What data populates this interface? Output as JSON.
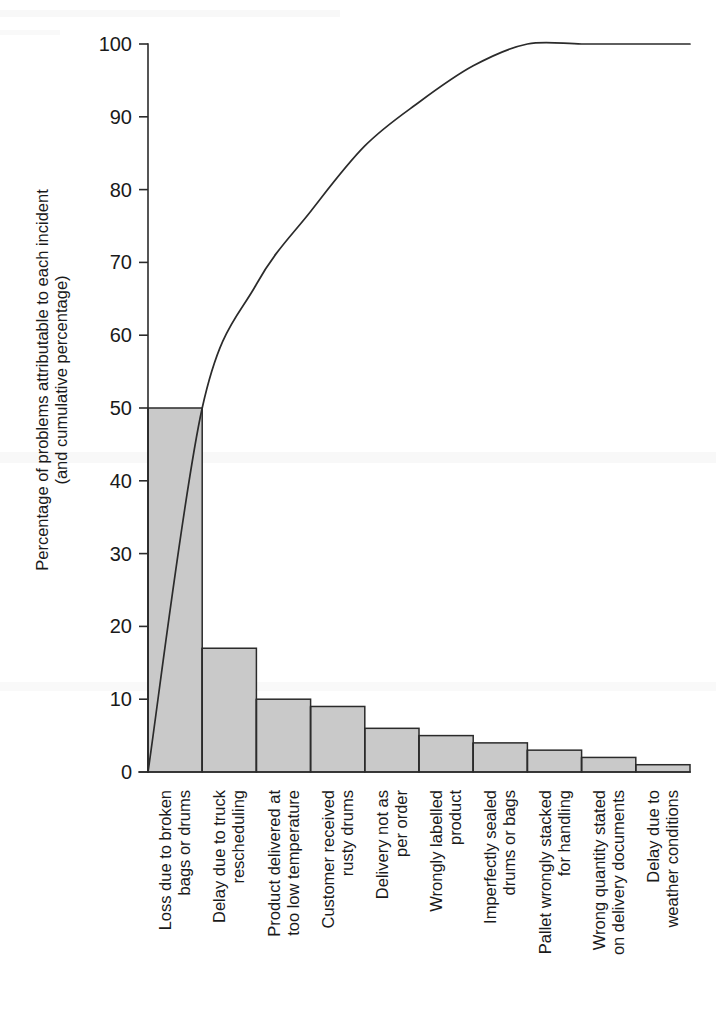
{
  "chart_data": {
    "type": "bar",
    "title": "",
    "subtitle": "",
    "xlabel": "",
    "ylabel": "Percentage of problems attributable to each incident (and cumulative percentage)",
    "ylabel_lines": [
      "Percentage of problems attributable to each incident",
      "(and cumulative percentage)"
    ],
    "ylim": [
      0,
      100
    ],
    "yticks": [
      0,
      10,
      20,
      30,
      40,
      50,
      60,
      70,
      80,
      90,
      100
    ],
    "ytick_labels": [
      "0",
      "10",
      "20",
      "30",
      "40",
      "50",
      "60",
      "70",
      "80",
      "90",
      "100"
    ],
    "grid": false,
    "legend": false,
    "legend_position": "none",
    "categories": [
      "Loss due to broken bags or drums",
      "Delay due to truck rescheduling",
      "Product delivered at too low temperature",
      "Customer received rusty drums",
      "Delivery not as per order",
      "Wrongly labelled product",
      "Imperfectly sealed drums or bags",
      "Pallet wrongly stacked for handling",
      "Wrong quantity stated on delivery documents",
      "Delay due to weather conditions"
    ],
    "category_lines": [
      [
        "Loss due to broken",
        "bags or drums"
      ],
      [
        "Delay due to truck",
        "rescheduling"
      ],
      [
        "Product delivered at",
        "too low temperature"
      ],
      [
        "Customer received",
        "rusty drums"
      ],
      [
        "Delivery not as",
        "per order"
      ],
      [
        "Wrongly labelled",
        "product"
      ],
      [
        "Imperfectly sealed",
        "drums or bags"
      ],
      [
        "Pallet wrongly stacked",
        "for handling"
      ],
      [
        "Wrong quantity stated",
        "on delivery documents"
      ],
      [
        "Delay due to",
        "weather conditions"
      ]
    ],
    "series": [
      {
        "name": "Percentage of problems attributable to each incident",
        "type": "bar",
        "values": [
          50,
          17,
          10,
          9,
          6,
          5,
          4,
          3,
          2,
          1
        ]
      },
      {
        "name": "Cumulative percentage",
        "type": "line",
        "values": [
          50,
          67,
          77,
          86,
          92,
          97,
          100,
          100,
          100,
          100
        ]
      }
    ],
    "bar_fill_color": "#c9c9c9",
    "bar_edge_color": "#2b2b2b",
    "curve_color": "#2b2b2b",
    "background_color": "#ffffff"
  },
  "axes": {
    "y_tick_labels": [
      "100",
      "90",
      "80",
      "70",
      "60",
      "50",
      "40",
      "30",
      "20",
      "10",
      "0"
    ]
  }
}
